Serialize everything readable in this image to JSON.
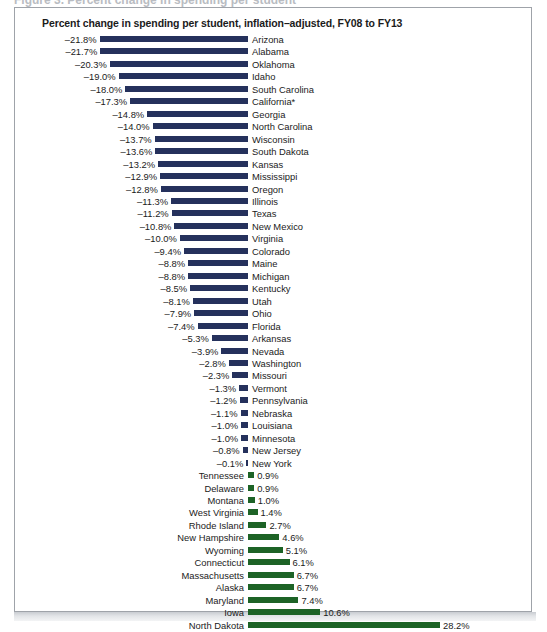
{
  "figure": {
    "top_sliver_text": "Figure 3.  Percent change in spending per student",
    "title": "Percent change in spending per student, inflation–adjusted, FY08 to FY13"
  },
  "colors": {
    "negative_bar": "#25315c",
    "positive_bar": "#1d6326",
    "frame_border": "#9fa3a9",
    "text": "#1b1b1b",
    "background": "#ffffff"
  },
  "chart_data": {
    "type": "bar",
    "orientation": "horizontal",
    "title": "Percent change in spending per student, inflation–adjusted, FY08 to FY13",
    "xlabel": "",
    "ylabel": "",
    "xlim": [
      -21.8,
      28.2
    ],
    "grid": false,
    "legend": "none",
    "value_suffix": "%",
    "categories": [
      "Arizona",
      "Alabama",
      "Oklahoma",
      "Idaho",
      "South Carolina",
      "California*",
      "Georgia",
      "North Carolina",
      "Wisconsin",
      "South Dakota",
      "Kansas",
      "Mississippi",
      "Oregon",
      "Illinois",
      "Texas",
      "New Mexico",
      "Virginia",
      "Colorado",
      "Maine",
      "Michigan",
      "Kentucky",
      "Utah",
      "Ohio",
      "Florida",
      "Arkansas",
      "Nevada",
      "Washington",
      "Missouri",
      "Vermont",
      "Pennsylvania",
      "Nebraska",
      "Louisiana",
      "Minnesota",
      "New Jersey",
      "New York",
      "Tennessee",
      "Delaware",
      "Montana",
      "West Virginia",
      "Rhode Island",
      "New Hampshire",
      "Wyoming",
      "Connecticut",
      "Massachusetts",
      "Alaska",
      "Maryland",
      "Iowa",
      "North Dakota"
    ],
    "values": [
      -21.8,
      -21.7,
      -20.3,
      -19.0,
      -18.0,
      -17.3,
      -14.8,
      -14.0,
      -13.7,
      -13.6,
      -13.2,
      -12.9,
      -12.8,
      -11.3,
      -11.2,
      -10.8,
      -10.0,
      -9.4,
      -8.8,
      -8.8,
      -8.5,
      -8.1,
      -7.9,
      -7.4,
      -5.3,
      -3.9,
      -2.8,
      -2.3,
      -1.3,
      -1.2,
      -1.1,
      -1.0,
      -1.0,
      -0.8,
      -0.1,
      0.9,
      0.9,
      1.0,
      1.4,
      2.7,
      4.6,
      5.1,
      6.1,
      6.7,
      6.7,
      7.4,
      10.6,
      28.2
    ],
    "labels": [
      "–21.8%",
      "–21.7%",
      "–20.3%",
      "–19.0%",
      "–18.0%",
      "–17.3%",
      "–14.8%",
      "–14.0%",
      "–13.7%",
      "–13.6%",
      "–13.2%",
      "–12.9%",
      "–12.8%",
      "–11.3%",
      "–11.2%",
      "–10.8%",
      "–10.0%",
      "–9.4%",
      "–8.8%",
      "–8.8%",
      "–8.5%",
      "–8.1%",
      "–7.9%",
      "–7.4%",
      "–5.3%",
      "–3.9%",
      "–2.8%",
      "–2.3%",
      "–1.3%",
      "–1.2%",
      "–1.1%",
      "–1.0%",
      "–1.0%",
      "–0.8%",
      "–0.1%",
      "0.9%",
      "0.9%",
      "1.0%",
      "1.4%",
      "2.7%",
      "4.6%",
      "5.1%",
      "6.1%",
      "6.7%",
      "6.7%",
      "7.4%",
      "10.6%",
      "28.2%"
    ]
  }
}
